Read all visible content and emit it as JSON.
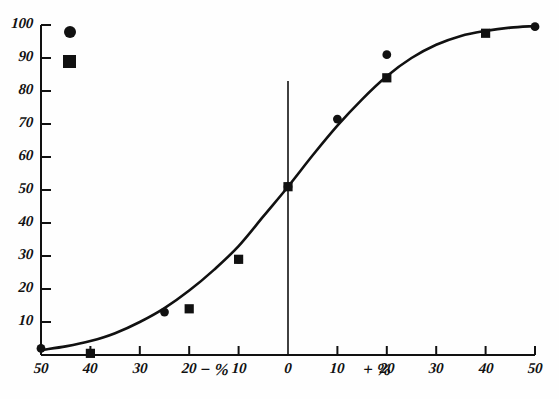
{
  "chart_data": {
    "type": "scatter",
    "title": "",
    "subtitle": "",
    "xlabel_negative": "− %",
    "xlabel_positive": "+ %",
    "ylabel": "",
    "xlim": [
      -50,
      50
    ],
    "ylim": [
      0,
      100
    ],
    "grid": false,
    "legend_position": "top-left",
    "x_ticks": [
      {
        "value": -50,
        "label": "50"
      },
      {
        "value": -40,
        "label": "40"
      },
      {
        "value": -30,
        "label": "30"
      },
      {
        "value": -20,
        "label": "20"
      },
      {
        "value": -10,
        "label": "10"
      },
      {
        "value": 0,
        "label": "0"
      },
      {
        "value": 10,
        "label": "10"
      },
      {
        "value": 20,
        "label": "20"
      },
      {
        "value": 30,
        "label": "30"
      },
      {
        "value": 40,
        "label": "40"
      },
      {
        "value": 50,
        "label": "50"
      }
    ],
    "y_ticks": [
      {
        "value": 10,
        "label": "10"
      },
      {
        "value": 20,
        "label": "20"
      },
      {
        "value": 30,
        "label": "30"
      },
      {
        "value": 40,
        "label": "40"
      },
      {
        "value": 50,
        "label": "50"
      },
      {
        "value": 60,
        "label": "60"
      },
      {
        "value": 70,
        "label": "70"
      },
      {
        "value": 80,
        "label": "80"
      },
      {
        "value": 90,
        "label": "90"
      },
      {
        "value": 100,
        "label": "100"
      }
    ],
    "series": [
      {
        "name": "circle-series",
        "marker": "circle",
        "color": "#111111",
        "points": [
          {
            "x": -50,
            "y": 2
          },
          {
            "x": -25,
            "y": 13
          },
          {
            "x": -10,
            "y": 29
          },
          {
            "x": 0,
            "y": 51
          },
          {
            "x": 10,
            "y": 71.5
          },
          {
            "x": 20,
            "y": 91
          },
          {
            "x": 50,
            "y": 99.5
          }
        ]
      },
      {
        "name": "square-series",
        "marker": "square",
        "color": "#111111",
        "points": [
          {
            "x": -40,
            "y": 0.5
          },
          {
            "x": -20,
            "y": 14
          },
          {
            "x": -10,
            "y": 29
          },
          {
            "x": 0,
            "y": 51
          },
          {
            "x": 20,
            "y": 84
          },
          {
            "x": 40,
            "y": 97.5
          }
        ]
      }
    ],
    "fitted_curve": {
      "name": "sigmoid-fit",
      "description": "S-shaped psychometric curve through the data",
      "points": [
        {
          "x": -50,
          "y": 1.5
        },
        {
          "x": -45,
          "y": 2.6
        },
        {
          "x": -40,
          "y": 4.2
        },
        {
          "x": -35,
          "y": 6.6
        },
        {
          "x": -30,
          "y": 10.0
        },
        {
          "x": -25,
          "y": 14.2
        },
        {
          "x": -20,
          "y": 19.5
        },
        {
          "x": -15,
          "y": 25.8
        },
        {
          "x": -10,
          "y": 33.0
        },
        {
          "x": -5,
          "y": 42.0
        },
        {
          "x": 0,
          "y": 51.0
        },
        {
          "x": 5,
          "y": 60.5
        },
        {
          "x": 10,
          "y": 69.5
        },
        {
          "x": 15,
          "y": 77.5
        },
        {
          "x": 20,
          "y": 84.5
        },
        {
          "x": 25,
          "y": 90.0
        },
        {
          "x": 30,
          "y": 94.0
        },
        {
          "x": 35,
          "y": 96.7
        },
        {
          "x": 40,
          "y": 98.2
        },
        {
          "x": 45,
          "y": 99.2
        },
        {
          "x": 50,
          "y": 99.7
        }
      ]
    },
    "reference_line": {
      "name": "vertical-zero-line",
      "x": 0,
      "y_from": 0,
      "y_to": 83
    },
    "legend": [
      {
        "marker": "circle",
        "label": ""
      },
      {
        "marker": "square",
        "label": ""
      }
    ]
  }
}
